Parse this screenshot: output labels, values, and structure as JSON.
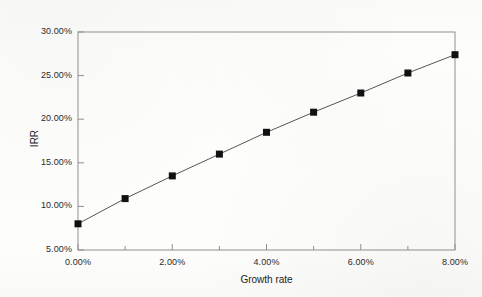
{
  "chart_data": {
    "type": "line",
    "title": "",
    "subtitle": "",
    "xlabel": "Growth rate",
    "ylabel": "IRR",
    "x": [
      0.0,
      1.0,
      2.0,
      3.0,
      4.0,
      5.0,
      6.0,
      7.0,
      8.0
    ],
    "series": [
      {
        "name": "IRR",
        "values": [
          8.0,
          10.9,
          13.5,
          16.0,
          18.5,
          20.8,
          23.0,
          25.3,
          27.4
        ]
      }
    ],
    "xlim": [
      0.0,
      8.0
    ],
    "ylim": [
      5.0,
      30.0
    ],
    "xticks": [
      0.0,
      2.0,
      4.0,
      6.0,
      8.0
    ],
    "xtick_labels": [
      "0.00%",
      "2.00%",
      "4.00%",
      "6.00%",
      "8.00%"
    ],
    "xminor_ticks": [
      1.0,
      3.0,
      5.0,
      7.0
    ],
    "yticks": [
      5.0,
      10.0,
      15.0,
      20.0,
      25.0,
      30.0
    ],
    "ytick_labels": [
      "5.00%",
      "10.00%",
      "15.00%",
      "20.00%",
      "25.00%",
      "30.00%"
    ],
    "grid": false,
    "legend": "none",
    "marker": "square",
    "marker_color": "#111111",
    "line_color": "#555555",
    "frame_color": "#8a8a8a",
    "background": "#fdfdfc"
  },
  "axes": {
    "x_title": "Growth rate",
    "y_title": "IRR"
  }
}
